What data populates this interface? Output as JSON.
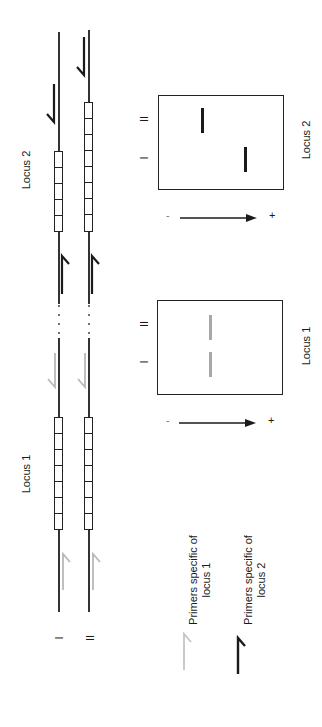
{
  "figure": {
    "orientation": "rotated -90deg",
    "loci": [
      {
        "label": "Locus 1",
        "repeat_units_allele_I": 7,
        "repeat_units_allele_II": 7,
        "primer_color": "#b0b0b0"
      },
      {
        "label": "Locus 2",
        "repeat_units_allele_I": 5,
        "repeat_units_allele_II": 8,
        "primer_color": "#1a1a1a"
      }
    ],
    "alleles": {
      "I": "I",
      "II": "II"
    },
    "gels": [
      {
        "label": "Locus 2",
        "lane_I": "I",
        "lane_II": "II",
        "band_color": "#1a1a1a",
        "polarity_minus": "-",
        "polarity_plus": "+"
      },
      {
        "label": "Locus 1",
        "lane_I": "I",
        "lane_II": "II",
        "band_color": "#a8a8a8",
        "polarity_minus": "-",
        "polarity_plus": "+"
      }
    ],
    "legend": [
      {
        "label": "Primers specific of locus 1",
        "line1": "Primers specific of",
        "line2": "locus 1",
        "color": "#b8b8b8",
        "icon": "primer-half-arrow-icon"
      },
      {
        "label": "Primers specific of locus 2",
        "line1": "Primers specific of",
        "line2": "locus 2",
        "color": "#1a1a1a",
        "icon": "primer-half-arrow-icon"
      }
    ],
    "colors": {
      "line": "#333333",
      "dark_primer": "#1a1a1a",
      "light_primer": "#b8b8b8",
      "dark_band": "#1a1a1a",
      "light_band": "#a8a8a8"
    }
  }
}
